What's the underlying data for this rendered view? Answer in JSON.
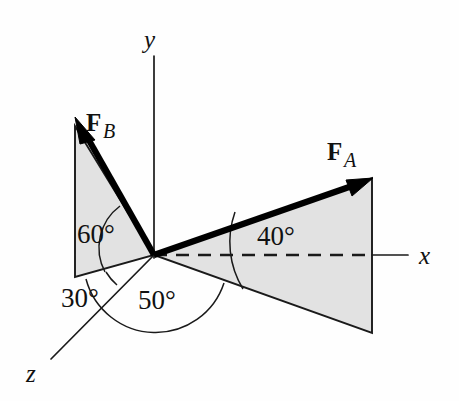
{
  "figure": {
    "background_color": "#fefefe",
    "shade_color": "#e2e2e2",
    "line_color": "#1a1a1a",
    "vector_color": "#000000"
  },
  "axes": [
    {
      "name": "y-axis",
      "label": "y"
    },
    {
      "name": "x-axis",
      "label": "x"
    },
    {
      "name": "z-axis",
      "label": "z"
    }
  ],
  "axis_labels": {
    "x": "x",
    "y": "y",
    "z": "z"
  },
  "vectors": [
    {
      "name": "force-b",
      "label_main": "F",
      "label_sub": "B",
      "direction": "up-left"
    },
    {
      "name": "force-a",
      "label_main": "F",
      "label_sub": "A",
      "direction": "up-right"
    }
  ],
  "vector_labels": {
    "fb_main": "F",
    "fb_sub": "B",
    "fa_main": "F",
    "fa_sub": "A"
  },
  "angles": [
    {
      "name": "angle-60",
      "label": "60°",
      "value": 60,
      "between": "FB and lower-left edge of FB plane"
    },
    {
      "name": "angle-30",
      "label": "30°",
      "value": 30,
      "between": "negative-x projection and FB plane base"
    },
    {
      "name": "angle-50",
      "label": "50°",
      "value": 50,
      "between": "FA horizontal projection and negative-x direction"
    },
    {
      "name": "angle-40",
      "label": "40°",
      "value": 40,
      "between": "FA and its horizontal projection"
    }
  ],
  "angle_labels": {
    "a60": "60°",
    "a30": "30°",
    "a50": "50°",
    "a40": "40°"
  }
}
